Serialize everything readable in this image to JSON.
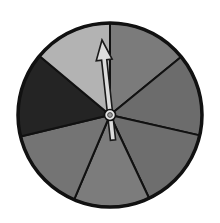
{
  "spinner": {
    "label": "Spinner with 7 sections",
    "center": [
      110,
      115
    ],
    "radius": 92,
    "outline_color": "#111111",
    "sections": [
      {
        "name": "top-right",
        "color": "#7b7b7b",
        "start": [
          110,
          23
        ],
        "end": [
          181,
          57
        ]
      },
      {
        "name": "right-upper",
        "color": "#6c6c6c",
        "start": [
          181,
          57
        ],
        "end": [
          198,
          135
        ]
      },
      {
        "name": "right-lower",
        "color": "#6e6e6e",
        "start": [
          198,
          135
        ],
        "end": [
          149,
          198
        ]
      },
      {
        "name": "bottom",
        "color": "#7c7c7c",
        "start": [
          149,
          198
        ],
        "end": [
          74,
          200
        ]
      },
      {
        "name": "left-lower",
        "color": "#747474",
        "start": [
          74,
          200
        ],
        "end": [
          23,
          136
        ]
      },
      {
        "name": "left-upper",
        "color": "#242424",
        "start": [
          23,
          136
        ],
        "end": [
          42,
          58
        ]
      },
      {
        "name": "top-left",
        "color": "#b3b3b3",
        "start": [
          42,
          58
        ],
        "end": [
          110,
          23
        ]
      }
    ],
    "pointer": {
      "tip": [
        102,
        40
      ],
      "tail": [
        113,
        140
      ],
      "fill": "#dcdcdc",
      "stroke": "#1a1a1a"
    },
    "hub": {
      "outer_color": "#e8e8e8",
      "inner_color": "#9a9a9a"
    }
  }
}
